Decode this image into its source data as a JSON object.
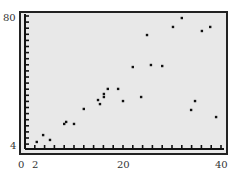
{
  "chart_data": {
    "type": "scatter",
    "title": "",
    "xlabel": "",
    "ylabel": "",
    "x_ticks_labeled": [
      0,
      2,
      20,
      40
    ],
    "y_ticks_labeled": [
      4,
      80
    ],
    "xlim": [
      0,
      41
    ],
    "ylim": [
      2,
      82
    ],
    "grid": false,
    "legend": null,
    "points": [
      {
        "x": 2.4,
        "y": 5.8
      },
      {
        "x": 3.7,
        "y": 9.9
      },
      {
        "x": 5.1,
        "y": 7.0
      },
      {
        "x": 8.0,
        "y": 16.5
      },
      {
        "x": 8.4,
        "y": 17.7
      },
      {
        "x": 10.0,
        "y": 16.5
      },
      {
        "x": 12.0,
        "y": 25.4
      },
      {
        "x": 14.9,
        "y": 30.7
      },
      {
        "x": 15.3,
        "y": 28.3
      },
      {
        "x": 16.1,
        "y": 34.3
      },
      {
        "x": 16.1,
        "y": 32.5
      },
      {
        "x": 16.9,
        "y": 37.3
      },
      {
        "x": 19.0,
        "y": 37.3
      },
      {
        "x": 20.0,
        "y": 30.1
      },
      {
        "x": 22.0,
        "y": 50.3
      },
      {
        "x": 23.7,
        "y": 32.5
      },
      {
        "x": 24.9,
        "y": 69.3
      },
      {
        "x": 25.7,
        "y": 51.5
      },
      {
        "x": 28.0,
        "y": 50.9
      },
      {
        "x": 30.2,
        "y": 74.1
      },
      {
        "x": 32.0,
        "y": 79.4
      },
      {
        "x": 33.9,
        "y": 24.8
      },
      {
        "x": 34.7,
        "y": 30.1
      },
      {
        "x": 36.1,
        "y": 71.7
      },
      {
        "x": 37.8,
        "y": 74.1
      },
      {
        "x": 39.0,
        "y": 20.6
      }
    ]
  },
  "colors": {
    "background": "#eaeaea",
    "frame": "#222222",
    "point": "#111111"
  }
}
